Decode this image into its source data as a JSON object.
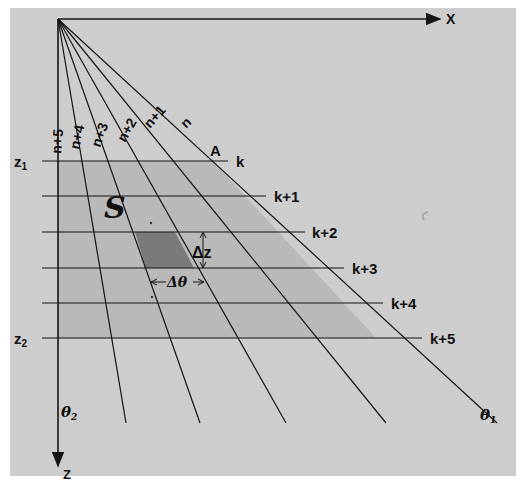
{
  "diagram": {
    "axes": {
      "x_label": "X",
      "z_label": "Z"
    },
    "depth_labels": {
      "z1": "z",
      "z1_sub": "1",
      "z2": "z",
      "z2_sub": "2"
    },
    "rays": [
      {
        "label": "n",
        "end": [
          497,
          423
        ]
      },
      {
        "label": "n+1",
        "end": [
          386,
          423
        ]
      },
      {
        "label": "n+2",
        "end": [
          286,
          423
        ]
      },
      {
        "label": "n+3",
        "end": [
          200,
          423
        ]
      },
      {
        "label": "n+4",
        "end": [
          126,
          423
        ]
      },
      {
        "label": "n+5",
        "end": [
          58,
          423
        ]
      }
    ],
    "levels": [
      {
        "label": "k",
        "y": 161,
        "x_end": 228
      },
      {
        "label": "k+1",
        "y": 196,
        "x_end": 266
      },
      {
        "label": "k+2",
        "y": 232,
        "x_end": 305
      },
      {
        "label": "k+3",
        "y": 268,
        "x_end": 344
      },
      {
        "label": "k+4",
        "y": 303,
        "x_end": 383
      },
      {
        "label": "k+5",
        "y": 338,
        "x_end": 422
      }
    ],
    "point_label": "A",
    "region_label": "S",
    "cell": {
      "dz_label": "Δz",
      "dtheta_label": "Δθ"
    },
    "angle_labels": {
      "theta1": "θ",
      "theta1_sub": "1",
      "theta2": "θ",
      "theta2_sub": "2"
    },
    "colors": {
      "paper": "#cdcdcd",
      "shaded_region": "#b9b9b9",
      "cell_fill": "#7a7a7a",
      "ink": "#141414"
    }
  }
}
